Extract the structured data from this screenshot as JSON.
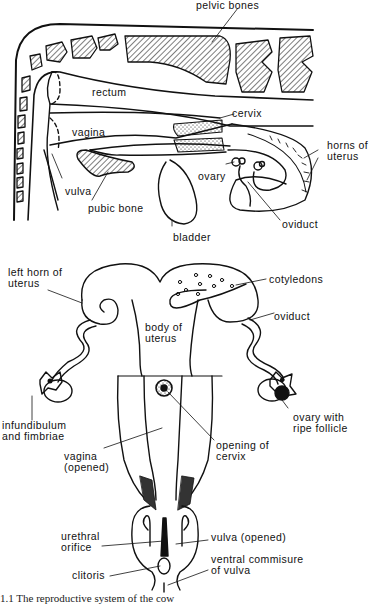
{
  "figure": {
    "caption": "1.1 The reproductive system of the cow",
    "ink_color": "#111111",
    "background": "#ffffff"
  },
  "lateral_view": {
    "labels": {
      "pelvic_bones": "pelvic bones",
      "rectum": "rectum",
      "cervix": "cervix",
      "vagina": "vagina",
      "horns_of_uterus": "horns of\nuterus",
      "ovary": "ovary",
      "vulva": "vulva",
      "pubic_bone": "pubic bone",
      "oviduct": "oviduct",
      "bladder": "bladder"
    }
  },
  "dorsal_view": {
    "labels": {
      "left_horn_of_uterus": "left horn of\nuterus",
      "cotyledons": "cotyledons",
      "body_of_uterus": "body of\nuterus",
      "oviduct": "oviduct",
      "infundibulum_and_fimbriae": "infundibulum\nand fimbriae",
      "ovary_with_ripe_follicle": "ovary with\nripe follicle",
      "opening_of_cervix": "opening of\ncervix",
      "vagina_opened": "vagina\n(opened)",
      "urethral_orifice": "urethral\norifice",
      "vulva_opened": "vulva (opened)",
      "clitoris": "clitoris",
      "ventral_commisure_of_vulva": "ventral commisure\nof vulva"
    }
  }
}
